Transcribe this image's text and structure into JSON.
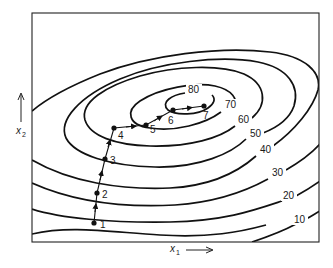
{
  "figure": {
    "type": "contour-plot-with-search-path",
    "x_axis_label": "x",
    "x_axis_subscript": "1",
    "y_axis_label": "x",
    "y_axis_subscript": "2",
    "contour_levels": [
      "10",
      "20",
      "30",
      "40",
      "50",
      "60",
      "70",
      "80"
    ],
    "path_points": [
      {
        "label": "1",
        "x": 94,
        "y": 223
      },
      {
        "label": "2",
        "x": 97,
        "y": 193
      },
      {
        "label": "3",
        "x": 105,
        "y": 159
      },
      {
        "label": "4",
        "x": 114,
        "y": 128
      },
      {
        "label": "5",
        "x": 146,
        "y": 125
      },
      {
        "label": "6",
        "x": 173,
        "y": 110
      },
      {
        "label": "7",
        "x": 204,
        "y": 106
      }
    ]
  }
}
